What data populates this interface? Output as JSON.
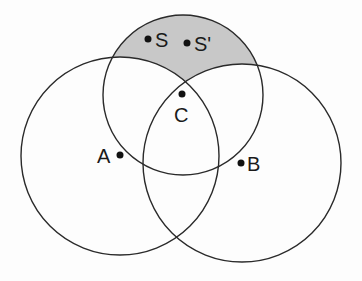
{
  "diagram": {
    "type": "three-circle venn",
    "colors": {
      "stroke": "#2a2a2a",
      "shade": "#c8c8c8",
      "background": "#fdfdfd"
    },
    "circles": [
      {
        "name": "circle-A",
        "cx": 120,
        "cy": 156,
        "r": 99
      },
      {
        "name": "circle-B",
        "cx": 242,
        "cy": 163,
        "r": 99
      },
      {
        "name": "circle-C",
        "cx": 183,
        "cy": 95,
        "r": 80
      }
    ],
    "shaded_region": "top circle outside circles A and B",
    "points": [
      {
        "label": "S",
        "x": 148,
        "y": 39
      },
      {
        "label": "S'",
        "x": 187,
        "y": 43
      },
      {
        "label": "C",
        "x": 182,
        "y": 94
      },
      {
        "label": "A",
        "x": 120,
        "y": 155
      },
      {
        "label": "B",
        "x": 241,
        "y": 163
      }
    ]
  }
}
